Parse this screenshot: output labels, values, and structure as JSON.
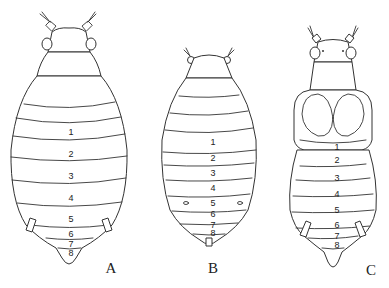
{
  "figures": [
    {
      "label": "A",
      "segments": [
        "1",
        "2",
        "3",
        "4",
        "5",
        "6",
        "7",
        "8"
      ]
    },
    {
      "label": "B",
      "segments": [
        "1",
        "2",
        "3",
        "4",
        "5",
        "6",
        "7",
        "8"
      ]
    },
    {
      "label": "C",
      "segments": [
        "1",
        "2",
        "3",
        "4",
        "5",
        "6",
        "7",
        "8"
      ]
    }
  ]
}
